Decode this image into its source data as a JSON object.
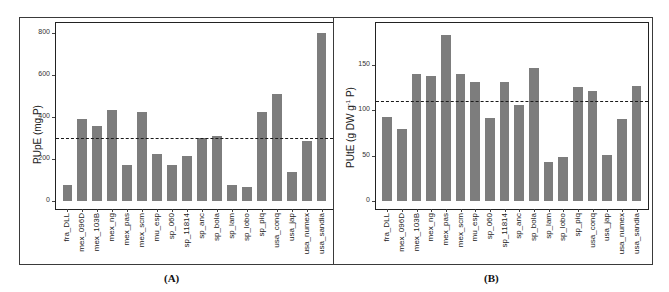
{
  "chart_data": [
    {
      "type": "bar",
      "panel_label": "(A)",
      "title": "",
      "xlabel": "",
      "ylabel": "PUpE (mg P)",
      "ylim": [
        0,
        820
      ],
      "yticks": [
        0,
        200,
        400,
        600,
        800
      ],
      "grid": false,
      "legend": null,
      "reference_line": {
        "value": 300,
        "style": "dashed"
      },
      "categories": [
        "fra_DLL",
        "mex_096D",
        "mex_103B",
        "mex_ng",
        "mex_pas",
        "mex_scm",
        "mu_esp",
        "sp_060",
        "sp_11814",
        "sp_anc",
        "sp_bola",
        "sp_lam",
        "sp_lobo",
        "sp_piq",
        "usa_conq",
        "usa_jap",
        "usa_numex",
        "usa_sandia"
      ],
      "values": [
        75,
        390,
        360,
        432,
        172,
        424,
        222,
        172,
        214,
        300,
        308,
        75,
        65,
        424,
        510,
        137,
        288,
        800
      ],
      "bar_color": "#7d7d7d"
    },
    {
      "type": "bar",
      "panel_label": "(B)",
      "title": "",
      "xlabel": "",
      "ylabel": "PUtE (g DW g-1 P)",
      "ylim": [
        0,
        190
      ],
      "yticks": [
        0,
        50,
        100,
        150
      ],
      "grid": false,
      "legend": null,
      "reference_line": {
        "value": 110,
        "style": "dashed"
      },
      "categories": [
        "fra_DLL",
        "mex_096D",
        "mex_103B",
        "mex_ng",
        "mex_pas",
        "mex_scm",
        "mu_esp",
        "sp_060",
        "sp_11814",
        "sp_anc",
        "sp_bola",
        "sp_lam",
        "sp_lobo",
        "sp_piq",
        "usa_conq",
        "usa_jap",
        "usa_numex",
        "usa_sandia"
      ],
      "values": [
        93,
        80,
        140,
        138,
        183,
        140,
        132,
        92,
        132,
        106,
        147,
        43,
        49,
        126,
        122,
        51,
        91,
        127
      ],
      "bar_color": "#7d7d7d"
    }
  ],
  "panels": {
    "a": {
      "caption": "(A)",
      "ylabel_main": "PUpE (mg P)"
    },
    "b": {
      "caption": "(B)",
      "ylabel_pre": "PUtE (g DW g",
      "ylabel_sup": "-1",
      "ylabel_post": " P)"
    }
  }
}
